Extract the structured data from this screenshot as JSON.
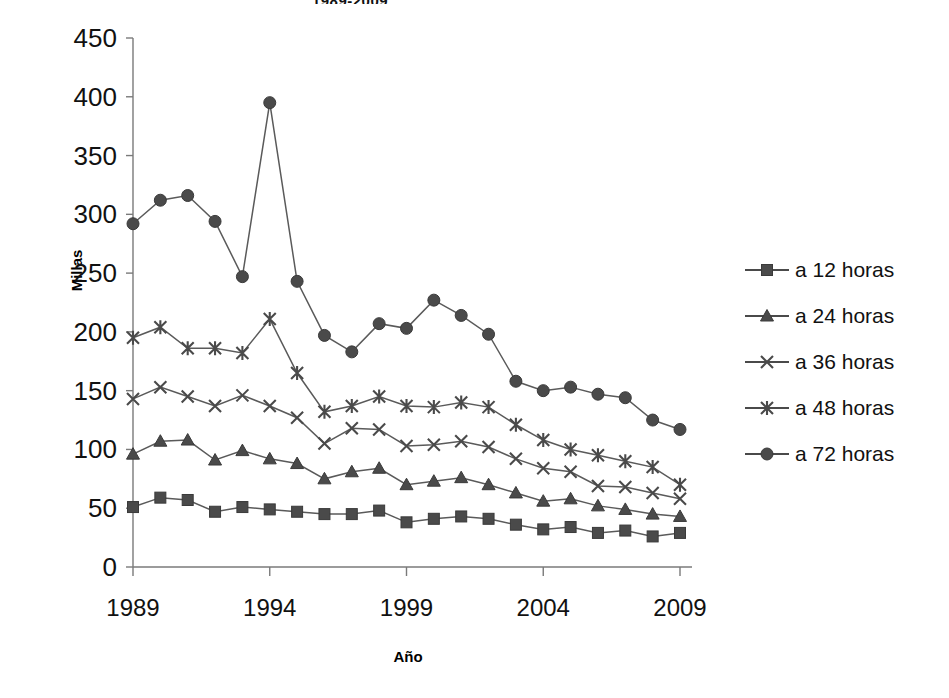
{
  "chart_data": {
    "type": "line",
    "title": "1989-2009",
    "xlabel": "Año",
    "ylabel": "Millas",
    "ylim": [
      0,
      450
    ],
    "ytick_step": 50,
    "yticks": [
      0,
      50,
      100,
      150,
      200,
      250,
      300,
      350,
      400,
      450
    ],
    "xlim": [
      1989,
      2009
    ],
    "xticks": [
      1989,
      1994,
      1999,
      2004,
      2009
    ],
    "grid": false,
    "legend_position": "right",
    "x": [
      1989,
      1990,
      1991,
      1992,
      1993,
      1994,
      1995,
      1996,
      1997,
      1998,
      1999,
      2000,
      2001,
      2002,
      2003,
      2004,
      2005,
      2006,
      2007,
      2008,
      2009
    ],
    "series": [
      {
        "name": "a 12 horas",
        "marker": "square",
        "color": "#4a4a4a",
        "values": [
          51,
          59,
          57,
          47,
          51,
          49,
          47,
          45,
          45,
          48,
          38,
          41,
          43,
          41,
          36,
          32,
          34,
          29,
          31,
          26,
          29
        ]
      },
      {
        "name": "a 24 horas",
        "marker": "triangle",
        "color": "#4a4a4a",
        "values": [
          96,
          107,
          108,
          91,
          99,
          92,
          88,
          75,
          81,
          84,
          70,
          73,
          76,
          70,
          63,
          56,
          58,
          52,
          49,
          45,
          43
        ]
      },
      {
        "name": "a 36 horas",
        "marker": "x",
        "color": "#4a4a4a",
        "values": [
          143,
          153,
          145,
          137,
          146,
          137,
          127,
          105,
          118,
          117,
          103,
          104,
          107,
          102,
          92,
          84,
          81,
          69,
          68,
          63,
          58
        ]
      },
      {
        "name": "a 48 horas",
        "marker": "asterisk",
        "color": "#4a4a4a",
        "values": [
          195,
          204,
          186,
          186,
          182,
          211,
          165,
          132,
          137,
          145,
          137,
          136,
          140,
          136,
          121,
          108,
          100,
          95,
          90,
          85,
          70
        ]
      },
      {
        "name": "a 72 horas",
        "marker": "circle",
        "color": "#4a4a4a",
        "values": [
          292,
          312,
          316,
          294,
          247,
          395,
          243,
          197,
          183,
          207,
          203,
          227,
          214,
          198,
          158,
          150,
          153,
          147,
          144,
          125,
          117
        ]
      }
    ]
  },
  "axes": {
    "y_tick_labels": [
      "450",
      "400",
      "350",
      "300",
      "250",
      "200",
      "150",
      "100",
      "50",
      "0"
    ],
    "x_tick_labels": [
      "1989",
      "1994",
      "1999",
      "2004",
      "2009"
    ],
    "y_axis_title": "Millas",
    "x_axis_title": "Año"
  },
  "legend": {
    "items": [
      {
        "label": "a 12 horas",
        "marker": "square"
      },
      {
        "label": "a 24 horas",
        "marker": "triangle"
      },
      {
        "label": "a 36 horas",
        "marker": "x"
      },
      {
        "label": "a 48 horas",
        "marker": "asterisk"
      },
      {
        "label": "a 72 horas",
        "marker": "circle"
      }
    ]
  }
}
